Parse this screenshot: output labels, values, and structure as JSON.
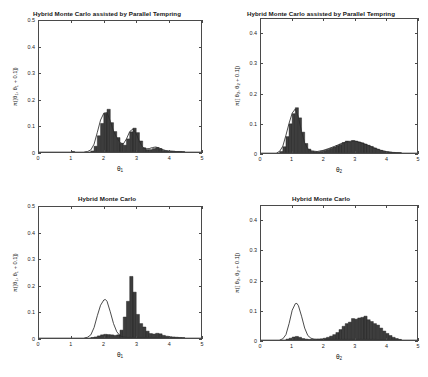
{
  "figure": {
    "width": 428,
    "height": 377,
    "background": "#ffffff",
    "series_color": "#2a2a2a",
    "axis_color": "#4a4a4a"
  },
  "panels": [
    {
      "key": "top_left",
      "title": "Hybrid Monte Carlo assisted by Parallel Tempring",
      "xlabel_main": "θ",
      "xlabel_sub": "1",
      "ylabel_prefix": "π([θ",
      "ylabel_sub1": "1",
      "ylabel_mid": ", θ",
      "ylabel_sub2": "1",
      "ylabel_suffix": " + 0.1])",
      "xticks": [
        "0",
        "1",
        "2",
        "3",
        "4",
        "5"
      ],
      "yticks": [
        "0",
        "0.1",
        "0.2",
        "0.3",
        "0.4",
        "0.5"
      ]
    },
    {
      "key": "top_right",
      "title": "Hybrid Monte Carlo assisted by Parallel Tempring",
      "xlabel_main": "θ",
      "xlabel_sub": "2",
      "ylabel_prefix": "π([ θ",
      "ylabel_sub1": "2",
      "ylabel_mid": ",  θ",
      "ylabel_sub2": "2",
      "ylabel_suffix": "  +  0.1])",
      "xticks": [
        "0",
        "1",
        "2",
        "3",
        "4",
        "5"
      ],
      "yticks": [
        "0",
        "0.1",
        "0.2",
        "0.3",
        "0.4"
      ]
    },
    {
      "key": "bottom_left",
      "title": "Hybrid Monte Carlo",
      "xlabel_main": "θ",
      "xlabel_sub": "1",
      "ylabel_prefix": "π([θ",
      "ylabel_sub1": "1",
      "ylabel_mid": ", θ",
      "ylabel_sub2": "1",
      "ylabel_suffix": " + 0.1])",
      "xticks": [
        "0",
        "1",
        "2",
        "3",
        "4",
        "5"
      ],
      "yticks": [
        "0",
        "0.1",
        "0.2",
        "0.3",
        "0.4",
        "0.5"
      ]
    },
    {
      "key": "bottom_right",
      "title": "Hybrid Monte Carlo",
      "xlabel_main": "θ",
      "xlabel_sub": "2",
      "ylabel_prefix": "π([ θ",
      "ylabel_sub1": "2",
      "ylabel_mid": ",  θ",
      "ylabel_sub2": "2",
      "ylabel_suffix": "  +  0.1])",
      "xticks": [
        "0",
        "1",
        "2",
        "3",
        "4",
        "5"
      ],
      "yticks": [
        "0",
        "0.1",
        "0.2",
        "0.3",
        "0.4"
      ]
    }
  ],
  "chart_data": [
    {
      "key": "top_left",
      "type": "bar",
      "title": "Hybrid Monte Carlo assisted by Parallel Tempring",
      "xlabel": "θ₁",
      "ylabel": "π([θ₁, θ₁ + 0.1])",
      "xlim": [
        0,
        5
      ],
      "ylim": [
        0,
        0.5
      ],
      "grid": false,
      "legend": "none",
      "bin_width": 0.1,
      "bin_starts": [
        1.0,
        1.1,
        1.2,
        1.3,
        1.4,
        1.5,
        1.6,
        1.7,
        1.8,
        1.9,
        2.0,
        2.1,
        2.2,
        2.3,
        2.4,
        2.5,
        2.6,
        2.7,
        2.8,
        2.9,
        3.0,
        3.1,
        3.2,
        3.3,
        3.4,
        3.5,
        3.6,
        3.7,
        3.8,
        3.9,
        4.0,
        4.1,
        4.2,
        4.3,
        4.4
      ],
      "values": [
        0.002,
        0.0,
        0.0,
        0.0,
        0.0,
        0.0,
        0.004,
        0.022,
        0.062,
        0.109,
        0.148,
        0.163,
        0.112,
        0.078,
        0.055,
        0.033,
        0.026,
        0.05,
        0.077,
        0.091,
        0.074,
        0.042,
        0.016,
        0.009,
        0.009,
        0.013,
        0.017,
        0.013,
        0.006,
        0.004,
        0.003,
        0.003,
        0.002,
        0.002,
        0.001
      ],
      "overlay_curve": {
        "name": "target density",
        "x": [
          1.4,
          1.5,
          1.6,
          1.7,
          1.8,
          1.9,
          2.0,
          2.1,
          2.2,
          2.3,
          2.4,
          2.5,
          2.6,
          2.7,
          2.8,
          2.9,
          3.0,
          3.1,
          3.2,
          3.3,
          3.4,
          3.5,
          3.6,
          3.7,
          3.8,
          3.9,
          4.0,
          4.2,
          4.5
        ],
        "y": [
          0.0,
          0.002,
          0.008,
          0.03,
          0.075,
          0.122,
          0.148,
          0.15,
          0.118,
          0.08,
          0.055,
          0.036,
          0.03,
          0.05,
          0.078,
          0.088,
          0.07,
          0.04,
          0.018,
          0.012,
          0.013,
          0.017,
          0.019,
          0.016,
          0.01,
          0.006,
          0.004,
          0.002,
          0.0
        ]
      }
    },
    {
      "key": "top_right",
      "type": "bar",
      "title": "Hybrid Monte Carlo assisted by Parallel Tempring",
      "xlabel": "θ₂",
      "ylabel": "π([ θ₂,  θ₂  +  0.1])",
      "xlim": [
        0,
        5
      ],
      "ylim": [
        0,
        0.45
      ],
      "grid": false,
      "legend": "none",
      "bin_width": 0.1,
      "bin_starts": [
        0.6,
        0.7,
        0.8,
        0.9,
        1.0,
        1.1,
        1.2,
        1.3,
        1.4,
        1.5,
        1.6,
        1.7,
        1.8,
        1.9,
        2.0,
        2.1,
        2.2,
        2.3,
        2.4,
        2.5,
        2.6,
        2.7,
        2.8,
        2.9,
        3.0,
        3.1,
        3.2,
        3.3,
        3.4,
        3.5,
        3.6,
        3.7,
        3.8,
        3.9,
        4.0,
        4.1,
        4.2,
        4.3,
        4.4
      ],
      "values": [
        0.005,
        0.021,
        0.055,
        0.098,
        0.132,
        0.152,
        0.118,
        0.07,
        0.032,
        0.013,
        0.006,
        0.004,
        0.004,
        0.006,
        0.009,
        0.012,
        0.016,
        0.02,
        0.025,
        0.029,
        0.035,
        0.04,
        0.038,
        0.042,
        0.04,
        0.037,
        0.034,
        0.03,
        0.026,
        0.022,
        0.017,
        0.013,
        0.009,
        0.006,
        0.004,
        0.003,
        0.002,
        0.001,
        0.001
      ],
      "overlay_curve": {
        "name": "target density",
        "x": [
          0.5,
          0.6,
          0.7,
          0.8,
          0.9,
          1.0,
          1.1,
          1.2,
          1.3,
          1.4,
          1.5,
          1.6,
          1.8,
          2.0,
          2.2,
          2.4,
          2.6,
          2.8,
          3.0,
          3.2,
          3.4,
          3.6,
          3.8,
          4.0,
          4.2,
          4.4,
          4.5
        ],
        "y": [
          0.0,
          0.006,
          0.023,
          0.06,
          0.1,
          0.134,
          0.148,
          0.12,
          0.072,
          0.034,
          0.014,
          0.007,
          0.005,
          0.009,
          0.016,
          0.024,
          0.033,
          0.039,
          0.04,
          0.035,
          0.027,
          0.018,
          0.01,
          0.005,
          0.002,
          0.001,
          0.0
        ]
      }
    },
    {
      "key": "bottom_left",
      "type": "bar",
      "title": "Hybrid Monte Carlo",
      "xlabel": "θ₁",
      "ylabel": "π([θ₁, θ₁ + 0.1])",
      "xlim": [
        0,
        5
      ],
      "ylim": [
        0,
        0.5
      ],
      "grid": false,
      "legend": "none",
      "bin_width": 0.1,
      "bin_starts": [
        1.6,
        1.7,
        1.8,
        1.9,
        2.0,
        2.1,
        2.2,
        2.3,
        2.4,
        2.5,
        2.6,
        2.7,
        2.8,
        2.9,
        3.0,
        3.1,
        3.2,
        3.3,
        3.4,
        3.5,
        3.6,
        3.7,
        3.8,
        3.9,
        4.0,
        4.1,
        4.2,
        4.3,
        4.4
      ],
      "values": [
        0.002,
        0.004,
        0.008,
        0.012,
        0.014,
        0.013,
        0.012,
        0.01,
        0.012,
        0.03,
        0.08,
        0.14,
        0.235,
        0.175,
        0.09,
        0.055,
        0.042,
        0.026,
        0.017,
        0.015,
        0.018,
        0.016,
        0.01,
        0.007,
        0.005,
        0.004,
        0.003,
        0.002,
        0.001
      ],
      "overlay_curve": {
        "name": "target density",
        "x": [
          1.4,
          1.5,
          1.6,
          1.7,
          1.8,
          1.9,
          2.0,
          2.05,
          2.1,
          2.2,
          2.3,
          2.4,
          2.5,
          2.6,
          2.7,
          2.8,
          2.9,
          3.0,
          3.2,
          3.4,
          3.6,
          3.8,
          4.0,
          4.3,
          4.5
        ],
        "y": [
          0.0,
          0.003,
          0.012,
          0.04,
          0.085,
          0.125,
          0.145,
          0.147,
          0.14,
          0.1,
          0.055,
          0.024,
          0.009,
          0.004,
          0.002,
          0.002,
          0.002,
          0.002,
          0.002,
          0.002,
          0.002,
          0.001,
          0.001,
          0.0,
          0.0
        ]
      }
    },
    {
      "key": "bottom_right",
      "type": "bar",
      "title": "Hybrid Monte Carlo",
      "xlabel": "θ₂",
      "ylabel": "π([ θ₂,  θ₂  +  0.1])",
      "xlim": [
        0,
        5
      ],
      "ylim": [
        0,
        0.45
      ],
      "grid": false,
      "legend": "none",
      "bin_width": 0.1,
      "bin_starts": [
        0.8,
        0.9,
        1.0,
        1.1,
        1.2,
        1.3,
        1.4,
        1.5,
        1.6,
        1.7,
        1.8,
        1.9,
        2.0,
        2.1,
        2.2,
        2.3,
        2.4,
        2.5,
        2.6,
        2.7,
        2.8,
        2.9,
        3.0,
        3.1,
        3.2,
        3.3,
        3.4,
        3.5,
        3.6,
        3.7,
        3.8,
        3.9,
        4.0,
        4.1,
        4.2,
        4.3,
        4.4
      ],
      "values": [
        0.003,
        0.006,
        0.01,
        0.012,
        0.009,
        0.005,
        0.003,
        0.002,
        0.002,
        0.002,
        0.003,
        0.004,
        0.006,
        0.009,
        0.013,
        0.018,
        0.025,
        0.035,
        0.046,
        0.055,
        0.06,
        0.072,
        0.07,
        0.074,
        0.076,
        0.08,
        0.068,
        0.062,
        0.055,
        0.05,
        0.04,
        0.03,
        0.022,
        0.015,
        0.009,
        0.005,
        0.002
      ],
      "overlay_curve": {
        "name": "target density",
        "x": [
          0.6,
          0.7,
          0.8,
          0.9,
          1.0,
          1.1,
          1.15,
          1.2,
          1.3,
          1.4,
          1.5,
          1.6,
          1.7,
          1.9,
          2.1,
          2.4,
          2.8,
          3.2,
          3.6,
          4.0,
          4.4,
          4.5
        ],
        "y": [
          0.0,
          0.004,
          0.018,
          0.055,
          0.1,
          0.122,
          0.123,
          0.115,
          0.08,
          0.04,
          0.015,
          0.006,
          0.003,
          0.002,
          0.002,
          0.002,
          0.002,
          0.002,
          0.002,
          0.001,
          0.001,
          0.0
        ]
      }
    }
  ]
}
